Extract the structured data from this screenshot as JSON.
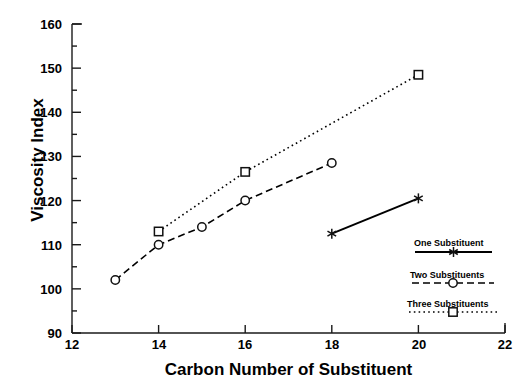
{
  "chart_data": {
    "type": "line",
    "title": "",
    "xlabel": "Carbon Number of Substituent",
    "ylabel": "Viscosity Index",
    "xlim": [
      12,
      22
    ],
    "ylim": [
      90,
      160
    ],
    "xticks": [
      12,
      14,
      16,
      18,
      20,
      22
    ],
    "yticks": [
      90,
      100,
      110,
      120,
      130,
      140,
      150,
      160
    ],
    "xtick_labels": [
      "12",
      "14",
      "16",
      "18",
      "20",
      "22"
    ],
    "ytick_labels": [
      "90",
      "100",
      "110",
      "120",
      "130",
      "140",
      "150",
      "160"
    ],
    "minor_ticks": true,
    "grid": false,
    "legend_position": "lower-right",
    "series": [
      {
        "name": "One Substituent",
        "marker": "asterisk",
        "linestyle": "solid",
        "color": "#000000",
        "points": [
          {
            "x": 18,
            "y": 112.5
          },
          {
            "x": 20,
            "y": 120.5
          }
        ]
      },
      {
        "name": "Two Substituents",
        "marker": "circle",
        "linestyle": "dashed",
        "color": "#000000",
        "points": [
          {
            "x": 13,
            "y": 102
          },
          {
            "x": 14,
            "y": 110
          },
          {
            "x": 15,
            "y": 114
          },
          {
            "x": 16,
            "y": 120
          },
          {
            "x": 18,
            "y": 128.5
          }
        ]
      },
      {
        "name": "Three Substituents",
        "marker": "square",
        "linestyle": "dotted",
        "color": "#000000",
        "points": [
          {
            "x": 14,
            "y": 113
          },
          {
            "x": 16,
            "y": 126.5
          },
          {
            "x": 20,
            "y": 148.5
          }
        ]
      }
    ]
  },
  "legend": {
    "entries": [
      {
        "label": "One Substituent"
      },
      {
        "label": "Two Substituents"
      },
      {
        "label": "Three Substituents"
      }
    ]
  }
}
